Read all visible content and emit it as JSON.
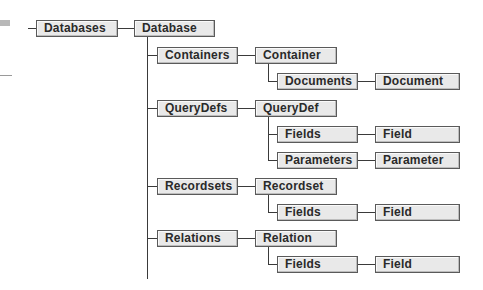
{
  "diagram": {
    "nodes": {
      "databases": "Databases",
      "database": "Database",
      "containers": "Containers",
      "container": "Container",
      "documents": "Documents",
      "document": "Document",
      "querydefs": "QueryDefs",
      "querydef": "QueryDef",
      "qd_fields": "Fields",
      "qd_field": "Field",
      "parameters": "Parameters",
      "parameter": "Parameter",
      "recordsets": "Recordsets",
      "recordset": "Recordset",
      "rs_fields": "Fields",
      "rs_field": "Field",
      "relations": "Relations",
      "relation": "Relation",
      "rel_fields": "Fields",
      "rel_field": "Field"
    },
    "colors": {
      "box_fill": "#e9e9e9",
      "box_border": "#5a5a5a",
      "connector": "#3a3a3a"
    }
  }
}
